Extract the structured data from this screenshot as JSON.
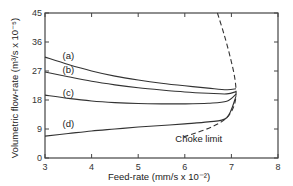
{
  "chart_data": {
    "type": "line",
    "title": "",
    "xlabel": "Feed-rate  (mm/s x 10⁻²)",
    "ylabel": "Volumetric flow-rate  (m³/s x 10⁻⁵)",
    "xlim": [
      3,
      8
    ],
    "ylim": [
      0,
      45
    ],
    "xticks": [
      3,
      4,
      5,
      6,
      7,
      8
    ],
    "yticks": [
      0,
      9,
      18,
      27,
      36,
      45
    ],
    "grid": false,
    "legend": "inline labels",
    "series": [
      {
        "name": "(a)",
        "style": "solid",
        "x": [
          3,
          3.5,
          4,
          4.5,
          5,
          5.5,
          6,
          6.5,
          6.9,
          7.1
        ],
        "y": [
          31.3,
          29.0,
          27.0,
          25.4,
          24.2,
          23.2,
          22.4,
          21.7,
          21.2,
          21.5
        ]
      },
      {
        "name": "(b)",
        "style": "solid",
        "x": [
          3,
          3.5,
          4,
          4.5,
          5,
          5.5,
          6,
          6.5,
          6.9,
          7.1
        ],
        "y": [
          26.7,
          25.2,
          23.8,
          22.7,
          21.8,
          21.1,
          20.5,
          20.1,
          19.9,
          20.6
        ]
      },
      {
        "name": "(c)",
        "style": "solid",
        "x": [
          3,
          3.5,
          4,
          4.5,
          5,
          5.5,
          6,
          6.5,
          6.9,
          7.1
        ],
        "y": [
          19.5,
          18.5,
          17.7,
          17.2,
          16.9,
          16.8,
          16.8,
          17.0,
          17.6,
          19.8
        ]
      },
      {
        "name": "(d)",
        "style": "solid",
        "x": [
          3,
          3.5,
          4,
          4.5,
          5,
          5.5,
          6,
          6.5,
          6.9,
          7.1
        ],
        "y": [
          6.8,
          7.6,
          8.4,
          9.0,
          9.6,
          10.1,
          10.6,
          11.2,
          12.5,
          19.2
        ]
      },
      {
        "name": "Choke limit",
        "style": "dashed",
        "x": [
          6.7,
          6.85,
          6.98,
          7.07,
          7.1,
          7.05,
          6.9,
          6.6,
          6.2,
          5.9
        ],
        "y": [
          45,
          38,
          31,
          25,
          20,
          16,
          12.5,
          9.8,
          7.6,
          6.3
        ]
      }
    ],
    "annotations": [
      {
        "text": "(a)",
        "x": 3.5,
        "y": 30.8
      },
      {
        "text": "(b)",
        "x": 3.5,
        "y": 26.3
      },
      {
        "text": "(c)",
        "x": 3.5,
        "y": 19.3
      },
      {
        "text": "(d)",
        "x": 3.5,
        "y": 9.5
      },
      {
        "text": "Choke limit",
        "x": 6.3,
        "y": 5
      }
    ]
  }
}
